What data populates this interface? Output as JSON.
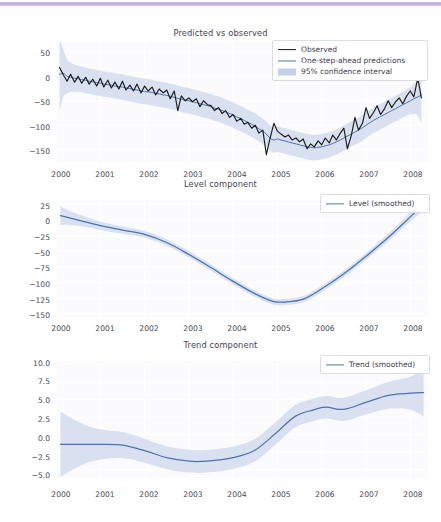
{
  "figure": {
    "accent_rule_color": "#c3a9dd",
    "background": "#ffffff",
    "observed_color": "#1b1b1b",
    "prediction_color": "#4c72b0",
    "band_color": "#b7c6e3",
    "smoothed_color": "#4c72b0"
  },
  "panels": [
    {
      "title": "Predicted vs observed",
      "yticks": [
        "50",
        "0",
        "−50",
        "−100",
        "−150"
      ],
      "xticks": [
        "2000",
        "2001",
        "2002",
        "2003",
        "2004",
        "2005",
        "2006",
        "2007",
        "2008"
      ],
      "legend": [
        {
          "label": "Observed",
          "kind": "line",
          "color": "#1b1b1b"
        },
        {
          "label": "One-step-ahead predictions",
          "kind": "line",
          "color": "#4c72b0"
        },
        {
          "label": "95% confidence interval",
          "kind": "band",
          "color": "#c4d1ea"
        }
      ]
    },
    {
      "title": "Level component",
      "yticks": [
        "25",
        "0",
        "−25",
        "−50",
        "−75",
        "−100",
        "−125",
        "−150"
      ],
      "xticks": [
        "2000",
        "2001",
        "2002",
        "2003",
        "2004",
        "2005",
        "2006",
        "2007",
        "2008"
      ],
      "legend": [
        {
          "label": "Level (smoothed)",
          "kind": "line",
          "color": "#4c72b0"
        }
      ]
    },
    {
      "title": "Trend component",
      "yticks": [
        "10.0",
        "7.5",
        "5.0",
        "2.5",
        "0.0",
        "−2.5",
        "−5.0"
      ],
      "xticks": [
        "2000",
        "2001",
        "2002",
        "2003",
        "2004",
        "2005",
        "2006",
        "2007",
        "2008"
      ],
      "legend": [
        {
          "label": "Trend (smoothed)",
          "kind": "line",
          "color": "#4c72b0"
        }
      ]
    }
  ],
  "chart_data": [
    {
      "type": "line",
      "title": "Predicted vs observed",
      "xlabel": "",
      "ylabel": "",
      "xlim": [
        2000.0,
        2008.4
      ],
      "ylim": [
        -175,
        70
      ],
      "grid": true,
      "legend_position": "upper right",
      "x": [
        2000.08,
        2000.17,
        2000.25,
        2000.33,
        2000.42,
        2000.5,
        2000.58,
        2000.67,
        2000.75,
        2000.83,
        2000.92,
        2001.0,
        2001.08,
        2001.17,
        2001.25,
        2001.33,
        2001.42,
        2001.5,
        2001.58,
        2001.67,
        2001.75,
        2001.83,
        2001.92,
        2002.0,
        2002.08,
        2002.17,
        2002.25,
        2002.33,
        2002.42,
        2002.5,
        2002.58,
        2002.67,
        2002.75,
        2002.83,
        2002.92,
        2003.0,
        2003.08,
        2003.17,
        2003.25,
        2003.33,
        2003.42,
        2003.5,
        2003.58,
        2003.67,
        2003.75,
        2003.83,
        2003.92,
        2004.0,
        2004.08,
        2004.17,
        2004.25,
        2004.33,
        2004.42,
        2004.5,
        2004.58,
        2004.67,
        2004.75,
        2004.83,
        2004.92,
        2005.0,
        2005.08,
        2005.17,
        2005.25,
        2005.33,
        2005.42,
        2005.5,
        2005.58,
        2005.67,
        2005.75,
        2005.83,
        2005.92,
        2006.0,
        2006.08,
        2006.17,
        2006.25,
        2006.33,
        2006.42,
        2006.5,
        2006.58,
        2006.67,
        2006.75,
        2006.83,
        2006.92,
        2007.0,
        2007.08,
        2007.17,
        2007.25,
        2007.33,
        2007.42,
        2007.5,
        2007.58,
        2007.67,
        2007.75,
        2007.83,
        2007.92,
        2008.0,
        2008.08,
        2008.17,
        2008.25
      ],
      "series": [
        {
          "name": "Observed",
          "color": "#1b1b1b",
          "values": [
            18,
            2,
            -10,
            4,
            -12,
            0,
            -14,
            -2,
            -16,
            -6,
            -20,
            -4,
            -22,
            -8,
            -24,
            -12,
            -26,
            -10,
            -28,
            -18,
            -30,
            -16,
            -34,
            -20,
            -30,
            -22,
            -38,
            -26,
            -34,
            -28,
            -46,
            -30,
            -70,
            -40,
            -50,
            -44,
            -52,
            -46,
            -62,
            -50,
            -58,
            -60,
            -70,
            -64,
            -76,
            -70,
            -84,
            -78,
            -92,
            -86,
            -98,
            -94,
            -106,
            -100,
            -116,
            -110,
            -160,
            -128,
            -96,
            -112,
            -118,
            -124,
            -120,
            -130,
            -126,
            -134,
            -128,
            -148,
            -138,
            -144,
            -132,
            -140,
            -126,
            -136,
            -120,
            -130,
            -116,
            -106,
            -148,
            -120,
            -84,
            -110,
            -96,
            -64,
            -86,
            -74,
            -60,
            -78,
            -66,
            -50,
            -64,
            -52,
            -44,
            -56,
            -40,
            -30,
            -42,
            -4,
            -44
          ]
        },
        {
          "name": "One-step-ahead predictions",
          "color": "#4c72b0",
          "values": [
            4,
            6,
            0,
            -2,
            -4,
            -5,
            -7,
            -8,
            -10,
            -11,
            -13,
            -14,
            -16,
            -17,
            -18,
            -20,
            -21,
            -22,
            -24,
            -25,
            -27,
            -28,
            -30,
            -31,
            -32,
            -33,
            -35,
            -36,
            -38,
            -39,
            -41,
            -43,
            -45,
            -47,
            -49,
            -50,
            -52,
            -54,
            -56,
            -58,
            -60,
            -62,
            -65,
            -67,
            -70,
            -73,
            -76,
            -79,
            -83,
            -86,
            -90,
            -94,
            -98,
            -102,
            -107,
            -112,
            -118,
            -126,
            -130,
            -128,
            -130,
            -132,
            -134,
            -136,
            -138,
            -140,
            -142,
            -144,
            -145,
            -146,
            -145,
            -144,
            -142,
            -140,
            -137,
            -134,
            -130,
            -126,
            -122,
            -118,
            -114,
            -110,
            -105,
            -100,
            -95,
            -90,
            -86,
            -82,
            -78,
            -74,
            -70,
            -66,
            -62,
            -58,
            -54,
            -50,
            -46,
            -42,
            -38
          ]
        }
      ],
      "confidence_interval": {
        "label": "95% confidence interval",
        "level": 0.95,
        "color": "#c4d1ea",
        "half_width_approx": 26
      }
    },
    {
      "type": "line",
      "title": "Level component",
      "xlabel": "",
      "ylabel": "",
      "xlim": [
        2000.0,
        2008.4
      ],
      "ylim": [
        -155,
        32
      ],
      "grid": true,
      "legend_position": "upper right",
      "x": [
        2000.1,
        2000.5,
        2001.0,
        2001.5,
        2002.0,
        2002.5,
        2003.0,
        2003.5,
        2004.0,
        2004.5,
        2004.9,
        2005.2,
        2005.6,
        2006.0,
        2006.5,
        2007.0,
        2007.5,
        2008.0,
        2008.3
      ],
      "series": [
        {
          "name": "Level (smoothed)",
          "color": "#4c72b0",
          "values": [
            7,
            0,
            -9,
            -16,
            -23,
            -36,
            -55,
            -76,
            -98,
            -118,
            -130,
            -131,
            -126,
            -110,
            -86,
            -58,
            -28,
            5,
            25
          ]
        }
      ],
      "confidence_interval": {
        "level": 0.95,
        "color": "#c4d1ea",
        "half_width_approx": 5
      }
    },
    {
      "type": "line",
      "title": "Trend component",
      "xlabel": "",
      "ylabel": "",
      "xlim": [
        2000.0,
        2008.4
      ],
      "ylim": [
        -6.2,
        10.5
      ],
      "grid": true,
      "legend_position": "upper right",
      "x": [
        2000.1,
        2000.6,
        2001.0,
        2001.5,
        2002.0,
        2002.5,
        2003.0,
        2003.4,
        2004.0,
        2004.5,
        2005.0,
        2005.4,
        2005.8,
        2006.1,
        2006.5,
        2007.0,
        2007.5,
        2008.0,
        2008.3
      ],
      "series": [
        {
          "name": "Trend (smoothed)",
          "color": "#4c72b0",
          "values": [
            -1.4,
            -1.4,
            -1.4,
            -1.5,
            -2.3,
            -3.3,
            -3.8,
            -3.8,
            -3.3,
            -2.2,
            0.4,
            2.6,
            3.5,
            3.9,
            3.6,
            4.6,
            5.6,
            5.9,
            6.0
          ]
        }
      ],
      "confidence_interval": {
        "level": 0.95,
        "color": "#c4d1ea",
        "half_width_approx": 1.6
      }
    }
  ]
}
